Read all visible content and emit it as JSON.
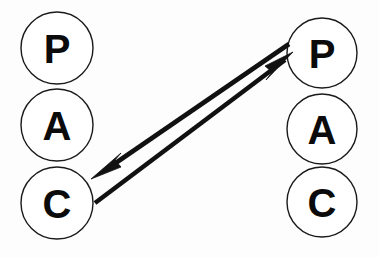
{
  "diagram": {
    "type": "two-column-node-diagram",
    "background_color": "#fdfdfd",
    "stroke_color": "#111111",
    "node_fill_color": "#ffffff",
    "label_color": "#0b0b0b",
    "columns": [
      {
        "name": "left-column",
        "nodes": [
          {
            "label": "P",
            "cx": 57,
            "cy": 48,
            "r": 36
          },
          {
            "label": "A",
            "cx": 57,
            "cy": 125,
            "r": 36
          },
          {
            "label": "C",
            "cx": 57,
            "cy": 203,
            "r": 36
          }
        ]
      },
      {
        "name": "right-column",
        "nodes": [
          {
            "label": "P",
            "cx": 322,
            "cy": 53,
            "r": 35
          },
          {
            "label": "A",
            "cx": 322,
            "cy": 129,
            "r": 35
          },
          {
            "label": "C",
            "cx": 322,
            "cy": 202,
            "r": 35
          }
        ]
      }
    ],
    "connectors": [
      {
        "name": "arrow-left-c-to-right-p",
        "direction": "up-right",
        "from": {
          "x": 96,
          "y": 203
        },
        "to": {
          "x": 291,
          "y": 55
        },
        "head_at": "to"
      },
      {
        "name": "arrow-right-p-to-left-c",
        "direction": "down-left",
        "from": {
          "x": 288,
          "y": 43
        },
        "to": {
          "x": 92,
          "y": 176
        },
        "head_at": "to"
      }
    ]
  }
}
